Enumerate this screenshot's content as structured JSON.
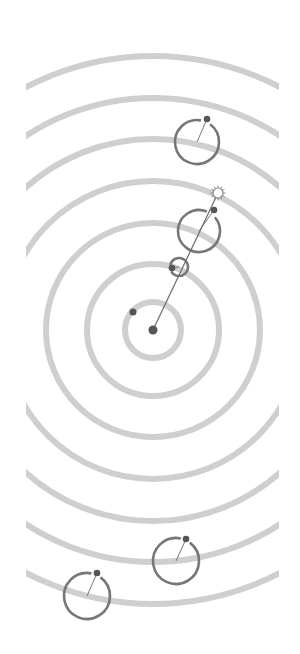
{
  "diagram": {
    "type": "concentric orbital diagram",
    "canvas": {
      "width": 300,
      "height": 654,
      "background": "#ffffff"
    },
    "center": {
      "x": 153,
      "y": 330
    },
    "clip": {
      "x_min": 26,
      "x_max": 279
    },
    "colors": {
      "ring": "#cfcfcf",
      "orbit_stroke": "#777777",
      "dot": "#555555",
      "sun_stroke": "#8a8a8a"
    },
    "rings": [
      {
        "r": 28
      },
      {
        "r": 66
      },
      {
        "r": 107
      },
      {
        "r": 149
      },
      {
        "r": 191
      },
      {
        "r": 232
      },
      {
        "r": 274
      }
    ],
    "central_body": {
      "x": 153,
      "y": 330,
      "r": 4.5
    },
    "free_dot": {
      "x": 133,
      "y": 312,
      "r": 3.5
    },
    "sun": {
      "x": 218,
      "y": 193,
      "r": 5,
      "rays": 12,
      "icon": "sun-icon"
    },
    "alignment_line": {
      "x1": 153,
      "y1": 330,
      "x2": 218,
      "y2": 193
    },
    "orbits": [
      {
        "name": "small-orbit",
        "cx": 179,
        "cy": 267,
        "r": 9,
        "dot": {
          "x": 172,
          "y": 268
        }
      },
      {
        "name": "large-orbit",
        "cx": 199,
        "cy": 231,
        "r": 21,
        "dot": {
          "x": 214,
          "y": 210
        }
      },
      {
        "name": "top-orbit",
        "cx": 197,
        "cy": 142,
        "r": 22,
        "dot": {
          "x": 207,
          "y": 119
        }
      },
      {
        "name": "lower-right-orbit",
        "cx": 176,
        "cy": 561,
        "r": 23,
        "dot": {
          "x": 186,
          "y": 539
        }
      },
      {
        "name": "lower-left-orbit",
        "cx": 87,
        "cy": 596,
        "r": 23,
        "dot": {
          "x": 97,
          "y": 573
        }
      }
    ]
  }
}
